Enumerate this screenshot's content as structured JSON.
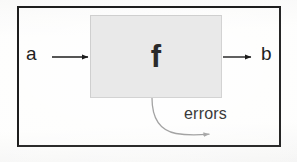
{
  "diagram": {
    "frame": {
      "name": "outer-frame"
    },
    "process_block": {
      "label": "f",
      "fill_color": "#e9e9e9",
      "border_color": "#d3d3d3"
    },
    "input": {
      "label": "a",
      "arrow": "right-arrow"
    },
    "output": {
      "label": "b",
      "arrow": "right-arrow"
    },
    "error_path": {
      "label": "errors",
      "arrow": "curved-arrow",
      "line_color": "#9a9a9a"
    },
    "colors": {
      "background": "#fbfbfa",
      "frame": "#1e1e1e",
      "ink": "#1f1f1f",
      "block_fill": "#e9e9e9",
      "faint_line": "#9a9a9a"
    }
  }
}
